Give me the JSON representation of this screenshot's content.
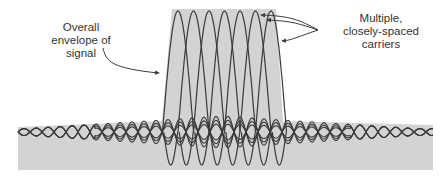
{
  "diagram": {
    "labels": {
      "envelope": "Overall\nenvelope of\nsignal",
      "carriers": "Multiple,\nclosely-spaced\ncarriers"
    },
    "carrier_count": 7,
    "colors": {
      "envelope_fill": "#d3d3d3",
      "curve": "#3a3a3a",
      "text": "#333333",
      "background": "#ffffff"
    }
  }
}
